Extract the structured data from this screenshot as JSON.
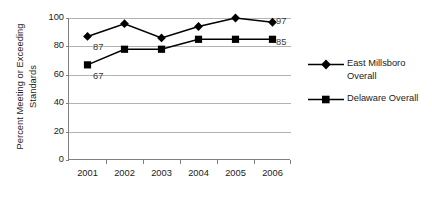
{
  "chart_data": {
    "type": "line",
    "title": "",
    "xlabel": "",
    "ylabel": "Percent Meeting or Exceeding Standards",
    "categories": [
      "2001",
      "2002",
      "2003",
      "2004",
      "2005",
      "2006"
    ],
    "ylim": [
      0,
      100
    ],
    "yticks": [
      0,
      20,
      40,
      60,
      80,
      100
    ],
    "grid": true,
    "legend_position": "right",
    "series": [
      {
        "name": "East Millsboro Overall",
        "marker": "diamond",
        "color": "#000000",
        "values": [
          87,
          96,
          86,
          94,
          100,
          97
        ],
        "point_labels": {
          "2001": "87",
          "2006": "97"
        }
      },
      {
        "name": "Delaware Overall",
        "marker": "square",
        "color": "#000000",
        "values": [
          67,
          78,
          78,
          85,
          85,
          85
        ],
        "point_labels": {
          "2001": "67",
          "2006": "85"
        }
      }
    ]
  },
  "axes": {
    "y_title": "Percent Meeting or Exceeding Standards",
    "y_tick_labels": [
      "100",
      "80",
      "60",
      "40",
      "20",
      "0"
    ],
    "x_tick_labels": [
      "2001",
      "2002",
      "2003",
      "2004",
      "2005",
      "2006"
    ]
  },
  "labels": {
    "east_first": "87",
    "east_last": "97",
    "delaware_first": "67",
    "delaware_last": "85"
  },
  "legend": {
    "items": [
      {
        "line1": "East Millsboro",
        "line2": "Overall",
        "marker": "diamond-marker"
      },
      {
        "line1": "Delaware Overall",
        "line2": "",
        "marker": "square-marker"
      }
    ]
  }
}
